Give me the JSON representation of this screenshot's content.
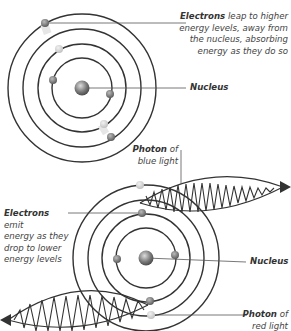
{
  "labels": {
    "absorb": {
      "bold": "Electrons",
      "lines": [
        " leap to higher",
        "energy levels, away from",
        "the nucleus, absorbing",
        "energy as they do so"
      ]
    },
    "nucleus_top": "Nucleus",
    "blue_photon": {
      "bold": "Photon",
      "rest": " of",
      "line2": "blue light"
    },
    "emit": {
      "bold": "Electrons",
      "lines": [
        " emit",
        "energy as they",
        "drop to lower",
        "energy levels"
      ]
    },
    "nucleus_bottom": "Nucleus",
    "red_photon": {
      "bold": "Photon",
      "rest": " of",
      "line2": "red light"
    }
  },
  "colors": {
    "ring": "#333333",
    "electron": "#7a7a7a",
    "electron_light": "#c8c8c8",
    "leader": "#555555"
  }
}
